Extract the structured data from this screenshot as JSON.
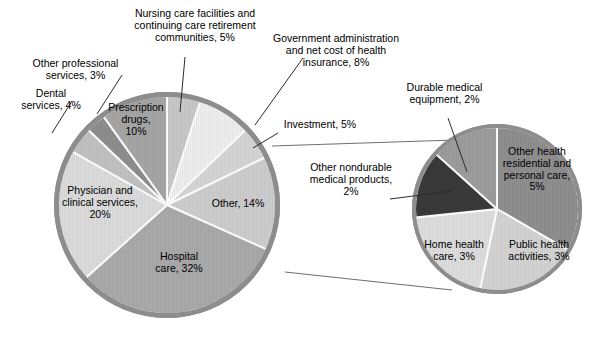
{
  "chart_data": {
    "type": "pie",
    "title": "",
    "subtitle": "",
    "xlabel": "",
    "ylabel": "",
    "legend_position": "none",
    "grid": false,
    "unit": "percent",
    "note": "Two pie charts: a main pie of national health expenditures, with its 'Other, 14%' slice exploded into a secondary breakout pie.",
    "charts": [
      {
        "name": "main-pie",
        "center": [
          167,
          205
        ],
        "radius": 113,
        "start_angle_deg": 0,
        "direction": "clockwise",
        "categories": [
          "Nursing care facilities and continuing care retirement communities",
          "Government administration and net cost of health insurance",
          "Investment",
          "Other",
          "Hospital care",
          "Physician and clinical services",
          "Dental services",
          "Other professional services",
          "Prescription drugs"
        ],
        "values": [
          5,
          8,
          5,
          14,
          32,
          20,
          4,
          3,
          10
        ],
        "colors": [
          "#c9c9c9",
          "#efefef",
          "#d6d6d6",
          "#cecece",
          "#aaaaaa",
          "#dcdcdc",
          "#c2c2c2",
          "#8e8e8e",
          "#a6a6a6"
        ]
      },
      {
        "name": "breakout-pie",
        "center": [
          497,
          209
        ],
        "radius": 85,
        "start_angle_deg": 0,
        "direction": "clockwise",
        "categories": [
          "Other health residential and personal care",
          "Public health activities",
          "Home health care",
          "Other nondurable medical products",
          "Durable medical equipment"
        ],
        "values": [
          5,
          3,
          3,
          2,
          2
        ],
        "colors": [
          "#8f8f8f",
          "#d4d4d4",
          "#dedede",
          "#3a3a3a",
          "#9d9d9d"
        ]
      }
    ]
  },
  "labels": {
    "nursing_care": "Nursing care facilities and\ncontinuing care retirement\ncommunities, 5%",
    "other_professional": "Other professional\nservices, 3%",
    "dental": "Dental\nservices, 4%",
    "prescription_drugs": "Prescription\ndrugs,\n10%",
    "government_admin": "Government administration\nand net cost of health\ninsurance, 8%",
    "investment": "Investment, 5%",
    "physician": "Physician and\nclinical services,\n20%",
    "hospital": "Hospital\ncare, 32%",
    "other": "Other, 14%",
    "durable_medical": "Durable medical\nequipment, 2%",
    "other_nondurable": "Other nondurable\nmedical products,\n2%",
    "other_health_residential": "Other health\nresidential and\npersonal care,\n5%",
    "home_health": "Home health\ncare, 3%",
    "public_health": "Public health\nactivities, 3%"
  },
  "colors": {
    "pie_rim": "#8d8d8d",
    "slice_divider": "#ffffff",
    "leader_line": "#4a4a4a",
    "text": "#000000",
    "background": "#ffffff"
  }
}
